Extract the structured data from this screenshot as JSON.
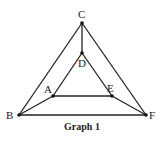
{
  "title": "Graph 1",
  "vertices": [
    {
      "id": "A",
      "label": "A"
    },
    {
      "id": "B",
      "label": "B"
    },
    {
      "id": "C",
      "label": "C"
    },
    {
      "id": "D",
      "label": "D"
    },
    {
      "id": "E",
      "label": "E"
    },
    {
      "id": "F",
      "label": "F"
    }
  ],
  "edges": [
    [
      "B",
      "C"
    ],
    [
      "C",
      "F"
    ],
    [
      "B",
      "F"
    ],
    [
      "C",
      "D"
    ],
    [
      "D",
      "A"
    ],
    [
      "D",
      "E"
    ],
    [
      "A",
      "E"
    ],
    [
      "A",
      "B"
    ],
    [
      "E",
      "F"
    ]
  ],
  "colors": {
    "line": "#222222",
    "background": "#ffffff"
  }
}
